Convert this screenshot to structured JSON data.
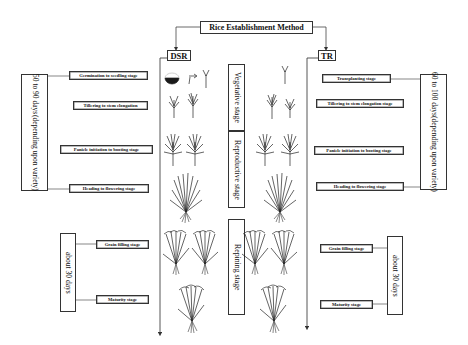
{
  "title": "Rice Establishment Method",
  "methods": {
    "dsr": {
      "label": "DSR"
    },
    "tr": {
      "label": "TR"
    }
  },
  "phases": [
    {
      "label": "Vegetative stage"
    },
    {
      "label": "Reproductive stage"
    },
    {
      "label": "Repining stage"
    }
  ],
  "dsr_stages": [
    {
      "label": "Germination to seedling stage"
    },
    {
      "label": "Tillering to stem elongation"
    },
    {
      "label": "Panicle initiation to booting stage"
    },
    {
      "label": "Heading to flowering stage"
    },
    {
      "label": "Grain filling stage"
    },
    {
      "label": "Maturity stage"
    }
  ],
  "tr_stages": [
    {
      "label": "Transplanting stage"
    },
    {
      "label": "Tillering to stem elongation stage"
    },
    {
      "label": "Panicle initiation to booting stage"
    },
    {
      "label": "Heading to flowering stage"
    },
    {
      "label": "Grain filling stage"
    },
    {
      "label": "Maturity stage"
    }
  ],
  "durations": {
    "dsr_main": {
      "line1": "50 to 90 days",
      "line2": "(depending upon variety)"
    },
    "dsr_ripening": {
      "label": "about 30 days"
    },
    "tr_main": {
      "line1": "60 to 100 days",
      "line2": "(depending upon variety)"
    },
    "tr_ripening": {
      "label": "about 30 days"
    }
  }
}
